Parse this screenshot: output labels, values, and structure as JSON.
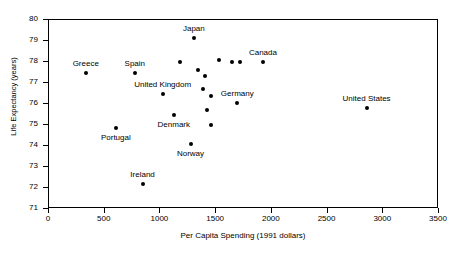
{
  "chart_data": {
    "type": "scatter",
    "title": "",
    "xlabel": "Per Capita Spending (1991 dollars)",
    "ylabel": "Life Expectancy (years)",
    "xlim": [
      0,
      3500
    ],
    "ylim": [
      71,
      80
    ],
    "xticks": [
      0,
      500,
      1000,
      1500,
      2000,
      2500,
      3000,
      3500
    ],
    "yticks": [
      71,
      72,
      73,
      74,
      75,
      76,
      77,
      78,
      79,
      80
    ],
    "grid": false,
    "legend": null,
    "marker_color": "#000000",
    "points": [
      {
        "label": "Greece",
        "label_pos": "above",
        "x": 330,
        "y": 77.5
      },
      {
        "label": "Spain",
        "label_pos": "above",
        "x": 770,
        "y": 77.5
      },
      {
        "label": "Portugal",
        "label_pos": "below",
        "x": 600,
        "y": 74.85
      },
      {
        "label": "Ireland",
        "label_pos": "above",
        "x": 840,
        "y": 72.2
      },
      {
        "label": "United Kingdom",
        "label_pos": "above",
        "x": 1020,
        "y": 76.5
      },
      {
        "label": "Denmark",
        "label_pos": "below",
        "x": 1120,
        "y": 75.5
      },
      {
        "label": "Japan",
        "label_pos": "above",
        "x": 1300,
        "y": 79.15
      },
      {
        "label": "Norway",
        "label_pos": "below",
        "x": 1270,
        "y": 74.1
      },
      {
        "label": "Germany",
        "label_pos": "above",
        "x": 1690,
        "y": 76.05
      },
      {
        "label": "Canada",
        "label_pos": "above",
        "x": 1920,
        "y": 78.0
      },
      {
        "label": "United States",
        "label_pos": "above",
        "x": 2850,
        "y": 75.8
      },
      {
        "label": "",
        "label_pos": "none",
        "x": 1340,
        "y": 77.6
      },
      {
        "label": "",
        "label_pos": "none",
        "x": 1400,
        "y": 77.35
      },
      {
        "label": "",
        "label_pos": "none",
        "x": 1380,
        "y": 76.7
      },
      {
        "label": "",
        "label_pos": "none",
        "x": 1450,
        "y": 76.4
      },
      {
        "label": "",
        "label_pos": "none",
        "x": 1420,
        "y": 75.7
      },
      {
        "label": "",
        "label_pos": "none",
        "x": 1530,
        "y": 78.1
      },
      {
        "label": "",
        "label_pos": "none",
        "x": 1640,
        "y": 78.0
      },
      {
        "label": "",
        "label_pos": "none",
        "x": 1710,
        "y": 78.0
      },
      {
        "label": "",
        "label_pos": "none",
        "x": 1180,
        "y": 78.0
      },
      {
        "label": "",
        "label_pos": "none",
        "x": 1450,
        "y": 75.0
      }
    ]
  }
}
